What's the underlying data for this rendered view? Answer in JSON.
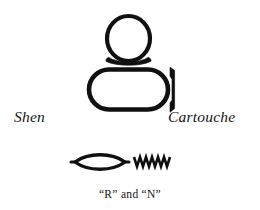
{
  "figure": {
    "background_color": "#ffffff",
    "ink_color": "#101010",
    "labels": {
      "shen": "Shen",
      "cartouche": "Cartouche",
      "phonetic_caption": "“R” and “N”"
    },
    "glyphs": [
      {
        "name": "shen-ring",
        "description": "circle above a horizontal tie bar",
        "label": "Shen"
      },
      {
        "name": "cartouche",
        "description": "elongated rounded oval with a vertical bar at the right end",
        "label": "Cartouche"
      },
      {
        "name": "mouth-glyph-r",
        "description": "pointed lens / mouth shape",
        "sound": "R"
      },
      {
        "name": "water-ripple-glyph-n",
        "description": "horizontal zigzag water ripple",
        "sound": "N",
        "peaks": 7
      }
    ]
  }
}
